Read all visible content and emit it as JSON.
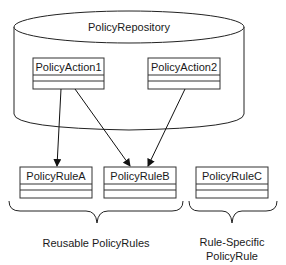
{
  "diagram": {
    "repository": {
      "label": "PolicyRepository"
    },
    "actions": [
      {
        "id": "action1",
        "label": "PolicyAction1"
      },
      {
        "id": "action2",
        "label": "PolicyAction2"
      }
    ],
    "rules": [
      {
        "id": "ruleA",
        "label": "PolicyRuleA"
      },
      {
        "id": "ruleB",
        "label": "PolicyRuleB"
      },
      {
        "id": "ruleC",
        "label": "PolicyRuleC"
      }
    ],
    "edges": [
      {
        "from": "PolicyAction1",
        "to": "PolicyRuleA"
      },
      {
        "from": "PolicyAction1",
        "to": "PolicyRuleB"
      },
      {
        "from": "PolicyAction2",
        "to": "PolicyRuleB"
      }
    ],
    "groups": [
      {
        "label": "Reusable PolicyRules",
        "members": [
          "PolicyRuleA",
          "PolicyRuleB"
        ]
      },
      {
        "label_line1": "Rule-Specific",
        "label_line2": "PolicyRule",
        "members": [
          "PolicyRuleC"
        ]
      }
    ]
  }
}
